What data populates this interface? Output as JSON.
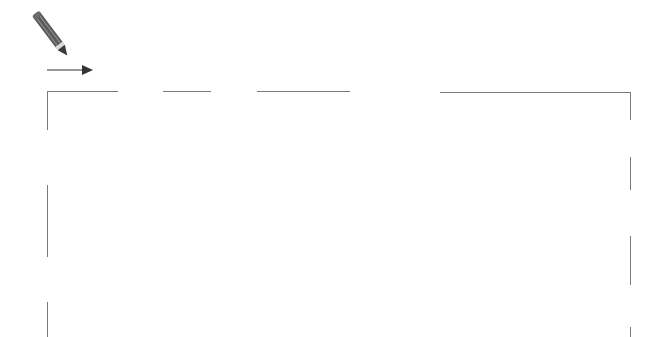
{
  "canvas": {
    "width": 651,
    "height": 337,
    "background": "#ffffff"
  },
  "tools": {
    "pencil": {
      "icon": "pencil-icon",
      "color": "#5a5a5a",
      "tip_color": "#dcdcdc"
    },
    "arrow": {
      "icon": "arrow-right-icon",
      "color": "#333333"
    }
  },
  "frame": {
    "stroke": "#7a7a7a",
    "top_segments": [
      {
        "x1": 47,
        "x2": 118,
        "y": 91
      },
      {
        "x1": 163,
        "x2": 211,
        "y": 91
      },
      {
        "x1": 257,
        "x2": 350,
        "y": 91
      },
      {
        "x1": 440,
        "x2": 631,
        "y": 92
      }
    ],
    "left_segments": [
      {
        "x": 47,
        "y1": 91,
        "y2": 130
      },
      {
        "x": 47,
        "y1": 185,
        "y2": 257
      },
      {
        "x": 47,
        "y1": 302,
        "y2": 337
      }
    ],
    "right_segments": [
      {
        "x": 630,
        "y1": 92,
        "y2": 120
      },
      {
        "x": 630,
        "y1": 157,
        "y2": 190
      },
      {
        "x": 630,
        "y1": 236,
        "y2": 285
      },
      {
        "x": 630,
        "y1": 327,
        "y2": 337
      }
    ]
  }
}
